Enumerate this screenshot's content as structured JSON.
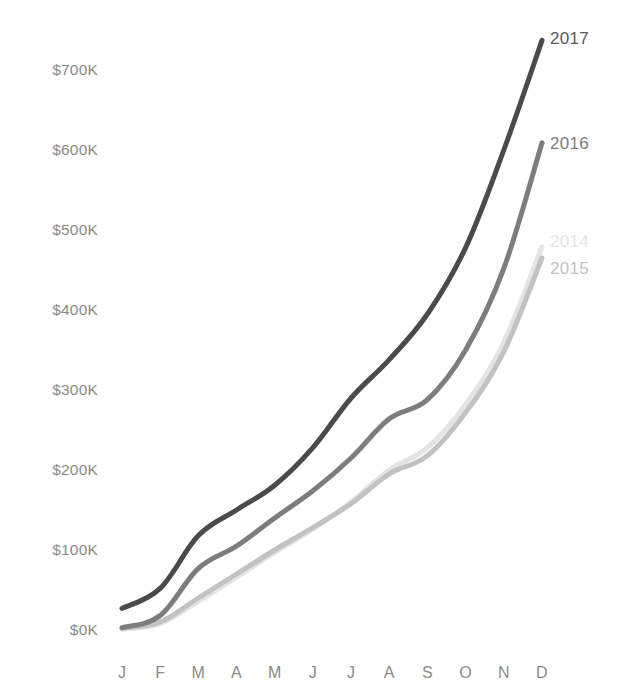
{
  "chart": {
    "background_color": "#ffffff",
    "axis_text_color": "#8a8a8a"
  },
  "chart_data": {
    "type": "line",
    "title": "",
    "subtitle": "",
    "xlabel": "",
    "ylabel": "",
    "grid": false,
    "legend_position": "right-end-of-line",
    "categories": [
      "J",
      "F",
      "M",
      "A",
      "M",
      "J",
      "J",
      "A",
      "S",
      "O",
      "N",
      "D"
    ],
    "category_full_names": [
      "January",
      "February",
      "March",
      "April",
      "May",
      "June",
      "July",
      "August",
      "September",
      "October",
      "November",
      "December"
    ],
    "xlim": [
      0,
      11
    ],
    "ylim": [
      0,
      780000
    ],
    "ytick_values": [
      0,
      100000,
      200000,
      300000,
      400000,
      500000,
      600000,
      700000
    ],
    "ytick_labels": [
      "$0K",
      "$100K",
      "$200K",
      "$300K",
      "$400K",
      "$500K",
      "$600K",
      "$700K"
    ],
    "value_unit": "USD",
    "series": [
      {
        "name": "2017",
        "label": "2017",
        "color": "#4a4a4a",
        "line_width": 5,
        "values": [
          27000,
          52000,
          118000,
          150000,
          181000,
          228000,
          290000,
          338000,
          395000,
          478000,
          600000,
          737000
        ]
      },
      {
        "name": "2016",
        "label": "2016",
        "color": "#7d7d7d",
        "line_width": 5,
        "values": [
          3000,
          18000,
          77000,
          105000,
          140000,
          174000,
          215000,
          264000,
          288000,
          350000,
          452000,
          609000
        ]
      },
      {
        "name": "2015",
        "label": "2015",
        "color": "#c2c2c2",
        "line_width": 5,
        "values": [
          2000,
          10000,
          40000,
          70000,
          100000,
          128000,
          158000,
          195000,
          218000,
          272000,
          348000,
          465000
        ]
      },
      {
        "name": "2014",
        "label": "2014",
        "color": "#e4e4e4",
        "line_width": 5,
        "values": [
          1000,
          8000,
          36000,
          66000,
          97000,
          126000,
          160000,
          200000,
          228000,
          282000,
          360000,
          479000
        ]
      }
    ]
  }
}
